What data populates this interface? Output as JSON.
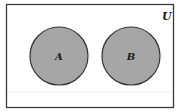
{
  "diagram": {
    "type": "venn",
    "universe": {
      "label": "U"
    },
    "sets": [
      {
        "label": "A",
        "shaded": true
      },
      {
        "label": "B",
        "shaded": true
      }
    ],
    "relationship": "disjoint",
    "colors": {
      "background": "#ffffff",
      "border": "#3a3a3a",
      "fill": "#a6a6a6",
      "text": "#1a1a1a"
    }
  }
}
